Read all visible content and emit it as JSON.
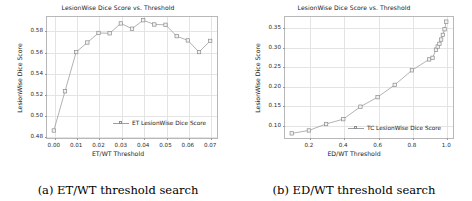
{
  "figure": {
    "subfigures": [
      {
        "caption": "(a) ET/WT threshold search",
        "chart_data": {
          "type": "line",
          "title": "LesionWise Dice Score vs. Threshold",
          "xlabel": "ET/WT Threshold",
          "ylabel": "LesionWise Dice Score",
          "legend": [
            "ET LesionWise Dice Score"
          ],
          "legend_position": "lower right",
          "grid": true,
          "xlim": [
            -0.0035,
            0.0735
          ],
          "ylim": [
            0.4775,
            0.5935
          ],
          "xticks": [
            0.0,
            0.01,
            0.02,
            0.03,
            0.04,
            0.05,
            0.06,
            0.07
          ],
          "xticklabels": [
            "0.00",
            "0.01",
            "0.02",
            "0.03",
            "0.04",
            "0.05",
            "0.06",
            "0.07"
          ],
          "yticks": [
            0.48,
            0.5,
            0.52,
            0.54,
            0.56,
            0.58
          ],
          "yticklabels": [
            "0.48",
            "0.50",
            "0.52",
            "0.54",
            "0.56",
            "0.58"
          ],
          "x": [
            0.0,
            0.005,
            0.01,
            0.015,
            0.02,
            0.025,
            0.03,
            0.035,
            0.04,
            0.045,
            0.05,
            0.055,
            0.06,
            0.065,
            0.07
          ],
          "series": [
            {
              "name": "ET LesionWise Dice Score",
              "values": [
                0.4855,
                0.5225,
                0.5595,
                0.5685,
                0.5775,
                0.5772,
                0.5865,
                0.5815,
                0.5895,
                0.5855,
                0.5852,
                0.5745,
                0.5705,
                0.5595,
                0.57
              ]
            }
          ]
        }
      },
      {
        "caption": "(b) ED/WT threshold search",
        "chart_data": {
          "type": "line",
          "title": "LesionWise Dice Score vs. Threshold",
          "xlabel": "ED/WT Threshold",
          "ylabel": "LesionWise Dice Score",
          "legend": [
            "TC LesionWise Dice Score"
          ],
          "legend_position": "lower right",
          "grid": true,
          "xlim": [
            0.055,
            1.045
          ],
          "ylim": [
            0.0635,
            0.3795
          ],
          "xticks": [
            0.2,
            0.4,
            0.6,
            0.8,
            1.0
          ],
          "xticklabels": [
            "0.2",
            "0.4",
            "0.6",
            "0.8",
            "1.0"
          ],
          "yticks": [
            0.1,
            0.15,
            0.2,
            0.25,
            0.3,
            0.35
          ],
          "yticklabels": [
            "0.10",
            "0.15",
            "0.20",
            "0.25",
            "0.30",
            "0.35"
          ],
          "x": [
            0.1,
            0.2,
            0.3,
            0.4,
            0.5,
            0.6,
            0.7,
            0.8,
            0.9,
            0.92,
            0.94,
            0.95,
            0.96,
            0.97,
            0.98,
            0.99,
            1.0
          ],
          "series": [
            {
              "name": "TC LesionWise Dice Score",
              "values": [
                0.078,
                0.0855,
                0.102,
                0.1145,
                0.1465,
                0.171,
                0.2025,
                0.24,
                0.268,
                0.272,
                0.293,
                0.301,
                0.308,
                0.319,
                0.331,
                0.3455,
                0.365
              ]
            }
          ]
        }
      }
    ]
  },
  "style": {
    "line_color": "#9aa0a6",
    "marker_edge_color": "#8d8d8d",
    "marker_face_color": "#f2f2f2",
    "grid_color": "#e4e4e4",
    "axes_color": "#b8b8b8"
  }
}
